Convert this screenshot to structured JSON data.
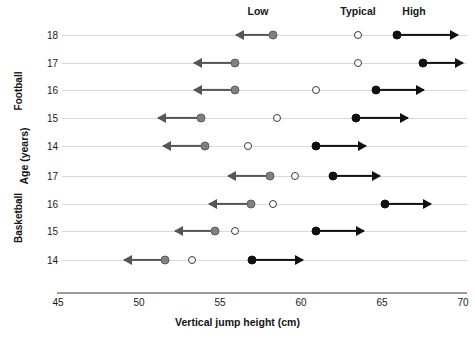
{
  "chart_data": {
    "type": "scatter",
    "title": "",
    "xlabel": "Vertical jump height (cm)",
    "ylabel": "Age (years)",
    "xlim": [
      45,
      70
    ],
    "xticks": [
      45,
      50,
      55,
      60,
      65,
      70
    ],
    "grid": "horizontal row lines",
    "legend_position": "top",
    "legend": [
      {
        "label": "Low",
        "marker": "filled gray circle with left arrow",
        "color": "#808080"
      },
      {
        "label": "Typical",
        "marker": "open circle",
        "color": "#ffffff"
      },
      {
        "label": "High",
        "marker": "filled black circle with right arrow",
        "color": "#111111"
      }
    ],
    "groups": [
      {
        "name": "Football",
        "rows": [
          {
            "age": "18",
            "low": 58.3,
            "typical": 63.5,
            "high": 65.9,
            "low_arrow_to": 56.0,
            "high_arrow_to": 69.7
          },
          {
            "age": "17",
            "low": 55.9,
            "typical": 63.5,
            "high": 67.5,
            "low_arrow_to": 53.4,
            "high_arrow_to": 70.0
          },
          {
            "age": "16",
            "low": 55.9,
            "typical": 60.9,
            "high": 64.6,
            "low_arrow_to": 53.4,
            "high_arrow_to": 67.6
          },
          {
            "age": "15",
            "low": 53.8,
            "typical": 58.5,
            "high": 63.4,
            "low_arrow_to": 51.2,
            "high_arrow_to": 66.6
          },
          {
            "age": "14",
            "low": 54.1,
            "typical": 56.7,
            "high": 60.9,
            "low_arrow_to": 51.5,
            "high_arrow_to": 64.0
          }
        ]
      },
      {
        "name": "Basketball",
        "rows": [
          {
            "age": "17",
            "low": 58.1,
            "typical": 59.6,
            "high": 62.0,
            "low_arrow_to": 55.5,
            "high_arrow_to": 64.9
          },
          {
            "age": "16",
            "low": 56.9,
            "typical": 58.3,
            "high": 65.2,
            "low_arrow_to": 54.3,
            "high_arrow_to": 68.0
          },
          {
            "age": "15",
            "low": 54.7,
            "typical": 55.9,
            "high": 60.9,
            "low_arrow_to": 52.2,
            "high_arrow_to": 63.9
          },
          {
            "age": "14",
            "low": 51.6,
            "typical": 53.3,
            "high": 57.0,
            "low_arrow_to": 49.1,
            "high_arrow_to": 60.1
          }
        ]
      }
    ]
  }
}
